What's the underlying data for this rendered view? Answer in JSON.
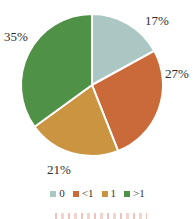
{
  "chart_data": {
    "type": "pie",
    "categories": [
      "0",
      "<1",
      "1",
      ">1"
    ],
    "values": [
      17,
      27,
      21,
      35
    ],
    "labels": [
      "17%",
      "27%",
      "21%",
      "35%"
    ],
    "colors": [
      "#abc7c4",
      "#ca6a38",
      "#cb9440",
      "#4f9147"
    ],
    "start_angle_deg": 0,
    "direction": "clockwise",
    "legend_position": "bottom",
    "slice_border_color": "#ffffff",
    "title": ""
  },
  "legend": {
    "items": [
      {
        "label": "0",
        "color": "#abc7c4"
      },
      {
        "label": "<1",
        "color": "#ca6a38"
      },
      {
        "label": "1",
        "color": "#cb9440"
      },
      {
        "label": ">1",
        "color": "#4f9147"
      }
    ]
  }
}
